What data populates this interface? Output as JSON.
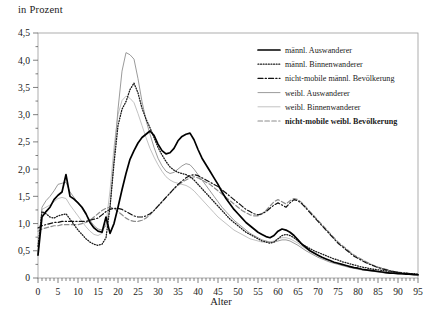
{
  "axes": {
    "ylabel": "in Prozent",
    "xlabel": "Alter",
    "yticks": [
      "4,5",
      "4,0",
      "3,5",
      "3,0",
      "2,5",
      "2,0",
      "1,5",
      "1,0",
      "0,5",
      "0"
    ],
    "xticks": [
      "0",
      "5",
      "10",
      "15",
      "20",
      "25",
      "30",
      "35",
      "40",
      "45",
      "50",
      "55",
      "60",
      "65",
      "70",
      "75",
      "80",
      "85",
      "90",
      "95"
    ]
  },
  "legend": {
    "items": [
      {
        "label": "männl. Auswanderer",
        "style": "solid-bold",
        "color": "#000000"
      },
      {
        "label": "männl. Binnenwanderer",
        "style": "dotted",
        "color": "#1a1a1a"
      },
      {
        "label": "nicht-mobile männl. Bevölkerung",
        "style": "dash-dot",
        "color": "#111111"
      },
      {
        "label": "weibl. Auswanderer",
        "style": "solid",
        "color": "#9b9b9b"
      },
      {
        "label": "weibl. Binnenwanderer",
        "style": "solid-light",
        "color": "#c2c2c2"
      },
      {
        "label": "nicht-mobile weibl. Bevölkerung",
        "style": "dashed",
        "color": "#8c8c8c"
      }
    ]
  },
  "chart_data": {
    "type": "line",
    "title": "",
    "xlabel": "Alter",
    "ylabel": "in Prozent",
    "xlim": [
      0,
      95
    ],
    "ylim": [
      0,
      4.5
    ],
    "grid": false,
    "legend_position": "top-right",
    "x": [
      0,
      1,
      2,
      3,
      4,
      5,
      6,
      7,
      8,
      9,
      10,
      11,
      12,
      13,
      14,
      15,
      16,
      17,
      18,
      19,
      20,
      21,
      22,
      23,
      24,
      25,
      26,
      27,
      28,
      29,
      30,
      31,
      32,
      33,
      34,
      35,
      36,
      37,
      38,
      39,
      40,
      41,
      42,
      43,
      44,
      45,
      46,
      47,
      48,
      49,
      50,
      51,
      52,
      53,
      54,
      55,
      56,
      57,
      58,
      59,
      60,
      61,
      62,
      63,
      64,
      65,
      66,
      67,
      68,
      69,
      70,
      71,
      72,
      73,
      74,
      75,
      76,
      77,
      78,
      79,
      80,
      81,
      82,
      83,
      84,
      85,
      86,
      87,
      88,
      89,
      90,
      91,
      92,
      93,
      94,
      95
    ],
    "series": [
      {
        "name": "männl. Auswanderer",
        "style": "solid-bold",
        "color": "#000000",
        "values": [
          0.42,
          1.12,
          1.22,
          1.3,
          1.44,
          1.52,
          1.58,
          1.9,
          1.5,
          1.45,
          1.38,
          1.3,
          1.18,
          1.02,
          0.92,
          0.86,
          0.84,
          1.12,
          0.82,
          1.0,
          1.3,
          1.62,
          1.92,
          2.18,
          2.34,
          2.48,
          2.58,
          2.64,
          2.7,
          2.62,
          2.46,
          2.34,
          2.28,
          2.3,
          2.38,
          2.52,
          2.6,
          2.64,
          2.66,
          2.54,
          2.36,
          2.2,
          2.08,
          1.96,
          1.84,
          1.72,
          1.58,
          1.46,
          1.36,
          1.26,
          1.18,
          1.1,
          1.02,
          0.96,
          0.9,
          0.84,
          0.8,
          0.76,
          0.74,
          0.78,
          0.86,
          0.9,
          0.88,
          0.84,
          0.78,
          0.7,
          0.62,
          0.56,
          0.5,
          0.46,
          0.42,
          0.38,
          0.35,
          0.32,
          0.29,
          0.27,
          0.25,
          0.23,
          0.21,
          0.19,
          0.18,
          0.16,
          0.15,
          0.14,
          0.13,
          0.12,
          0.11,
          0.1,
          0.09,
          0.09,
          0.08,
          0.08,
          0.07,
          0.07,
          0.06,
          0.06
        ]
      },
      {
        "name": "männl. Binnenwanderer",
        "style": "dotted",
        "color": "#1a1a1a",
        "values": [
          0.58,
          1.22,
          1.18,
          1.12,
          1.1,
          1.14,
          1.16,
          1.18,
          1.08,
          0.98,
          0.88,
          0.8,
          0.72,
          0.66,
          0.62,
          0.6,
          0.62,
          0.74,
          1.3,
          2.1,
          2.8,
          3.1,
          3.24,
          3.46,
          3.58,
          3.4,
          3.12,
          2.92,
          2.76,
          2.58,
          2.4,
          2.26,
          2.14,
          2.04,
          1.98,
          1.94,
          1.92,
          1.9,
          1.86,
          1.8,
          1.72,
          1.64,
          1.56,
          1.48,
          1.4,
          1.32,
          1.24,
          1.16,
          1.08,
          1.02,
          0.96,
          0.9,
          0.84,
          0.8,
          0.76,
          0.72,
          0.68,
          0.66,
          0.64,
          0.66,
          0.72,
          0.78,
          0.8,
          0.78,
          0.74,
          0.68,
          0.62,
          0.58,
          0.54,
          0.5,
          0.47,
          0.44,
          0.41,
          0.38,
          0.35,
          0.33,
          0.3,
          0.28,
          0.26,
          0.24,
          0.22,
          0.2,
          0.19,
          0.17,
          0.16,
          0.15,
          0.14,
          0.13,
          0.12,
          0.11,
          0.1,
          0.09,
          0.09,
          0.08,
          0.08,
          0.07
        ]
      },
      {
        "name": "nicht-mobile männl. Bevölkerung",
        "style": "dash-dot",
        "color": "#111111",
        "values": [
          0.92,
          0.96,
          0.98,
          1.0,
          1.02,
          1.02,
          1.04,
          1.04,
          1.04,
          1.04,
          1.04,
          1.04,
          1.04,
          1.06,
          1.08,
          1.1,
          1.16,
          1.22,
          1.26,
          1.28,
          1.28,
          1.26,
          1.22,
          1.18,
          1.14,
          1.12,
          1.12,
          1.14,
          1.18,
          1.24,
          1.32,
          1.4,
          1.48,
          1.56,
          1.64,
          1.72,
          1.78,
          1.84,
          1.88,
          1.9,
          1.88,
          1.84,
          1.8,
          1.76,
          1.72,
          1.68,
          1.62,
          1.56,
          1.5,
          1.44,
          1.38,
          1.32,
          1.26,
          1.22,
          1.18,
          1.16,
          1.18,
          1.22,
          1.28,
          1.34,
          1.38,
          1.34,
          1.3,
          1.38,
          1.44,
          1.42,
          1.36,
          1.28,
          1.2,
          1.12,
          1.04,
          0.96,
          0.88,
          0.8,
          0.72,
          0.64,
          0.58,
          0.52,
          0.46,
          0.4,
          0.36,
          0.32,
          0.28,
          0.25,
          0.22,
          0.19,
          0.17,
          0.15,
          0.13,
          0.12,
          0.1,
          0.09,
          0.08,
          0.07,
          0.07,
          0.06
        ]
      },
      {
        "name": "weibl. Auswanderer",
        "style": "solid",
        "color": "#9b9b9b",
        "values": [
          0.44,
          1.3,
          1.42,
          1.5,
          1.6,
          1.72,
          1.74,
          1.76,
          1.58,
          1.48,
          1.38,
          1.28,
          1.16,
          1.06,
          0.96,
          0.9,
          0.88,
          0.96,
          1.3,
          2.2,
          3.1,
          3.8,
          4.14,
          4.1,
          4.02,
          3.66,
          3.24,
          2.9,
          2.64,
          2.4,
          2.2,
          2.06,
          1.96,
          1.92,
          1.94,
          2.0,
          2.06,
          2.1,
          2.08,
          2.0,
          1.9,
          1.8,
          1.7,
          1.6,
          1.5,
          1.4,
          1.3,
          1.22,
          1.14,
          1.06,
          1.0,
          0.94,
          0.88,
          0.82,
          0.78,
          0.74,
          0.7,
          0.68,
          0.66,
          0.66,
          0.68,
          0.7,
          0.7,
          0.68,
          0.64,
          0.6,
          0.55,
          0.5,
          0.46,
          0.42,
          0.38,
          0.35,
          0.32,
          0.29,
          0.27,
          0.25,
          0.23,
          0.21,
          0.19,
          0.18,
          0.16,
          0.15,
          0.14,
          0.13,
          0.12,
          0.11,
          0.1,
          0.09,
          0.09,
          0.08,
          0.08,
          0.07,
          0.07,
          0.06,
          0.06,
          0.05
        ]
      },
      {
        "name": "weibl. Binnenwanderer",
        "style": "solid-light",
        "color": "#c2c2c2",
        "values": [
          0.5,
          1.26,
          1.3,
          1.34,
          1.4,
          1.46,
          1.48,
          1.46,
          1.34,
          1.24,
          1.14,
          1.04,
          0.94,
          0.86,
          0.8,
          0.78,
          0.82,
          1.0,
          1.6,
          2.4,
          3.0,
          3.26,
          3.34,
          3.3,
          3.22,
          3.02,
          2.8,
          2.58,
          2.38,
          2.22,
          2.08,
          1.96,
          1.86,
          1.8,
          1.76,
          1.74,
          1.72,
          1.7,
          1.66,
          1.6,
          1.52,
          1.44,
          1.36,
          1.28,
          1.2,
          1.12,
          1.06,
          1.0,
          0.94,
          0.88,
          0.84,
          0.8,
          0.76,
          0.72,
          0.7,
          0.68,
          0.66,
          0.66,
          0.66,
          0.68,
          0.72,
          0.74,
          0.74,
          0.72,
          0.68,
          0.64,
          0.58,
          0.54,
          0.49,
          0.45,
          0.41,
          0.38,
          0.35,
          0.32,
          0.29,
          0.27,
          0.25,
          0.23,
          0.21,
          0.19,
          0.18,
          0.16,
          0.15,
          0.14,
          0.13,
          0.12,
          0.11,
          0.1,
          0.09,
          0.09,
          0.08,
          0.08,
          0.07,
          0.07,
          0.06,
          0.06
        ]
      },
      {
        "name": "nicht-mobile weibl. Bevölkerung",
        "style": "dashed",
        "color": "#8c8c8c",
        "values": [
          0.86,
          0.9,
          0.92,
          0.94,
          0.96,
          0.96,
          0.98,
          0.98,
          0.98,
          0.98,
          0.98,
          1.0,
          1.02,
          1.06,
          1.12,
          1.18,
          1.24,
          1.28,
          1.3,
          1.28,
          1.22,
          1.16,
          1.1,
          1.06,
          1.04,
          1.04,
          1.06,
          1.1,
          1.16,
          1.24,
          1.32,
          1.4,
          1.48,
          1.56,
          1.64,
          1.7,
          1.76,
          1.8,
          1.84,
          1.86,
          1.84,
          1.8,
          1.76,
          1.72,
          1.66,
          1.6,
          1.54,
          1.48,
          1.42,
          1.36,
          1.3,
          1.24,
          1.2,
          1.16,
          1.14,
          1.14,
          1.18,
          1.24,
          1.32,
          1.4,
          1.44,
          1.4,
          1.36,
          1.42,
          1.46,
          1.44,
          1.38,
          1.3,
          1.22,
          1.14,
          1.06,
          0.98,
          0.9,
          0.82,
          0.74,
          0.66,
          0.6,
          0.54,
          0.48,
          0.42,
          0.38,
          0.34,
          0.3,
          0.26,
          0.23,
          0.2,
          0.18,
          0.16,
          0.14,
          0.12,
          0.11,
          0.1,
          0.09,
          0.08,
          0.07,
          0.06
        ]
      }
    ]
  }
}
